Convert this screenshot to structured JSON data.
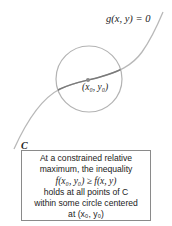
{
  "figure": {
    "constraint_label": "g(x, y) = 0",
    "point_label": "(x₀, y₀)",
    "curve_label": "C",
    "colors": {
      "curve": "#b5b5b5",
      "curve_inside": "#7a7a7a",
      "circle": "#b0b0b0",
      "point": "#8a8a8a",
      "box_border": "#8a8a8a"
    }
  },
  "caption": {
    "line1": "At a constrained relative",
    "line2": "maximum, the inequality",
    "line3": "f(x₀, y₀) ≥ f(x, y)",
    "line4": "holds at all points of C",
    "line5": "within some circle centered",
    "line6": "at (x₀, y₀)"
  }
}
